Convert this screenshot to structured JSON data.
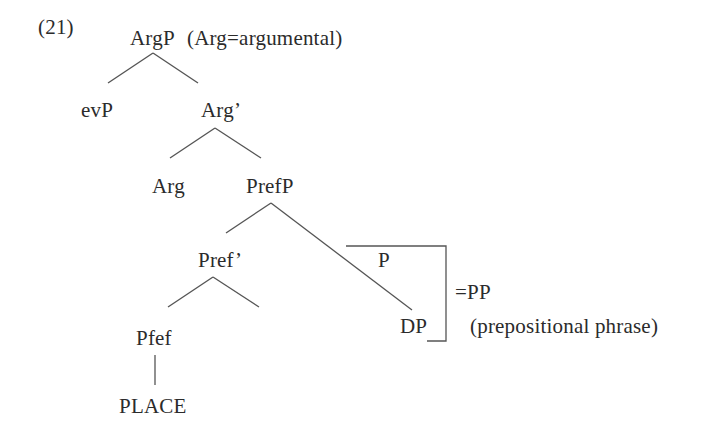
{
  "example_number": "(21)",
  "tree": {
    "root": {
      "label": "ArgP",
      "gloss": "(Arg=argumental)"
    },
    "nodes": {
      "evP": "evP",
      "arg_bar": "Arg’",
      "arg": "Arg",
      "prefP": "PrefP",
      "pref_bar": "Pref’",
      "pfef": "Pfef",
      "place": "PLACE",
      "p": "P",
      "dp": "DP"
    },
    "bracket": {
      "label": "=PP",
      "gloss": "(prepositional phrase)"
    },
    "edges": [
      {
        "from": "ArgP",
        "to": "evP"
      },
      {
        "from": "ArgP",
        "to": "Arg’"
      },
      {
        "from": "Arg’",
        "to": "Arg"
      },
      {
        "from": "Arg’",
        "to": "PrefP"
      },
      {
        "from": "PrefP",
        "to": "Pref’"
      },
      {
        "from": "PrefP",
        "to": "DP"
      },
      {
        "from": "Pref’",
        "to": "Pfef"
      },
      {
        "from": "Pref’",
        "to": "(empty)"
      },
      {
        "from": "Pfef",
        "to": "PLACE"
      }
    ]
  },
  "colors": {
    "text": "#2b2b2b",
    "lines": "#555555",
    "background": "#ffffff"
  }
}
